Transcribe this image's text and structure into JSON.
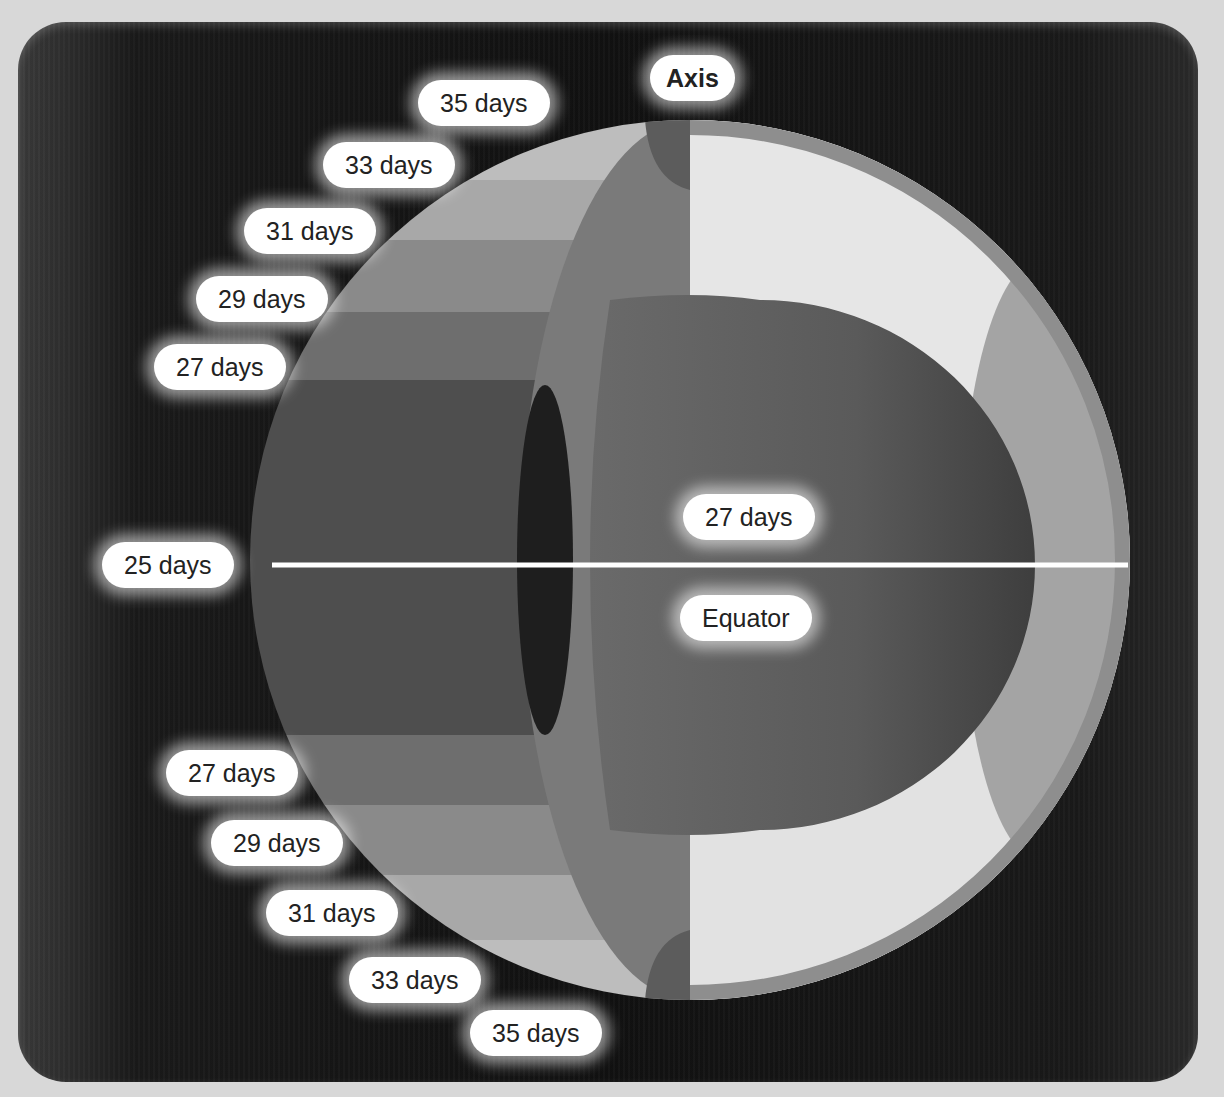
{
  "diagram": {
    "axis_label": "Axis",
    "equator_label": "Equator",
    "core_label": "27 days",
    "surface_labels_north": [
      "35 days",
      "33 days",
      "31 days",
      "29 days",
      "27 days"
    ],
    "surface_equator_label": "25 days",
    "surface_labels_south": [
      "27 days",
      "29 days",
      "31 days",
      "33 days",
      "35 days"
    ],
    "colors": {
      "background": "#111111",
      "label_fill": "#ffffff",
      "label_text": "#222222",
      "equator_line": "#ffffff"
    }
  }
}
